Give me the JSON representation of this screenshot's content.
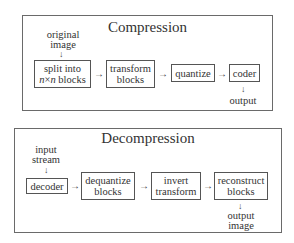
{
  "compression": {
    "title": "Compression",
    "input_label": [
      "original",
      "image"
    ],
    "steps": [
      {
        "line1": "split into",
        "line2_italic_a": "n",
        "line2_times": "×",
        "line2_italic_b": "n",
        "line2_rest": " blocks"
      },
      {
        "line1": "transform",
        "line2": "blocks"
      },
      {
        "line1": "quantize"
      },
      {
        "line1": "coder"
      }
    ],
    "output_label": [
      "output"
    ]
  },
  "decompression": {
    "title": "Decompression",
    "input_label": [
      "input",
      "stream"
    ],
    "steps": [
      {
        "line1": "decoder"
      },
      {
        "line1": "dequantize",
        "line2": "blocks"
      },
      {
        "line1": "invert",
        "line2": "transform"
      },
      {
        "line1": "reconstruct",
        "line2": "blocks"
      }
    ],
    "output_label": [
      "output",
      "image"
    ]
  },
  "icons": {
    "arrow_right": "→",
    "arrow_down": "↓"
  }
}
